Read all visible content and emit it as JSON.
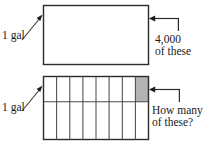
{
  "figure": {
    "background_color": "#ffffff",
    "stroke_color": "#2b2b2b",
    "shaded_cell_color": "#b3b3b3",
    "top_figure": {
      "name": "whole-gallon-rectangle",
      "unit_label": "1 gal",
      "callout_line_1": "4,000",
      "callout_line_2": "of these",
      "rows": 1,
      "columns": 1,
      "shaded_cells": 0
    },
    "bottom_figure": {
      "name": "partitioned-gallon-rectangle",
      "unit_label": "1 gal",
      "callout_line_1": "How many",
      "callout_line_2": "of these?",
      "rows": 2,
      "columns": 8,
      "total_cells": 16,
      "shaded_cells": 1,
      "shaded_cell_position": "top-right"
    }
  }
}
